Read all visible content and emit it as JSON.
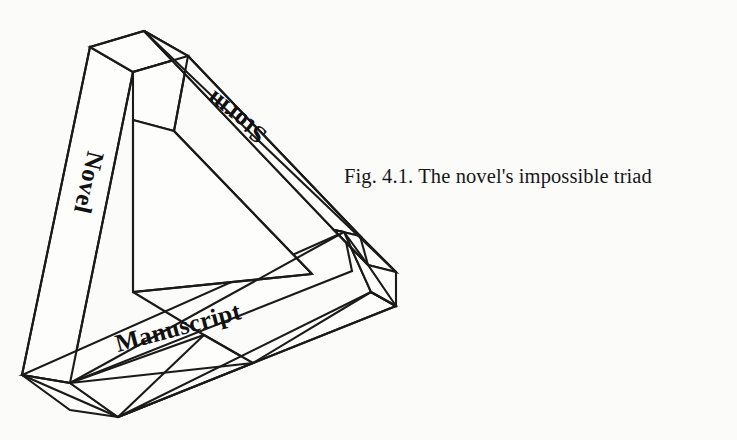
{
  "figure": {
    "type": "impossible-triangle-diagram",
    "caption": {
      "label": "Fig. 4.1.",
      "text": "The novel's impossible triad",
      "full": "Fig. 4.1. The novel's impossible triad"
    },
    "background_color": "#fbfbfa",
    "line_color": "#1a1a1a",
    "face_color": "#fdfdfc",
    "label_color": "#111111",
    "beams": [
      {
        "id": "left-beam",
        "label": "Novel",
        "rotation_deg": 103,
        "label_x": 88,
        "label_y": 150
      },
      {
        "id": "right-beam",
        "label": "Storm",
        "rotation_deg": 218,
        "label_x": 268,
        "label_y": 132
      },
      {
        "id": "bottom-beam",
        "label": "Manuscript",
        "rotation_deg": -15,
        "label_x": 118,
        "label_y": 352
      }
    ]
  }
}
